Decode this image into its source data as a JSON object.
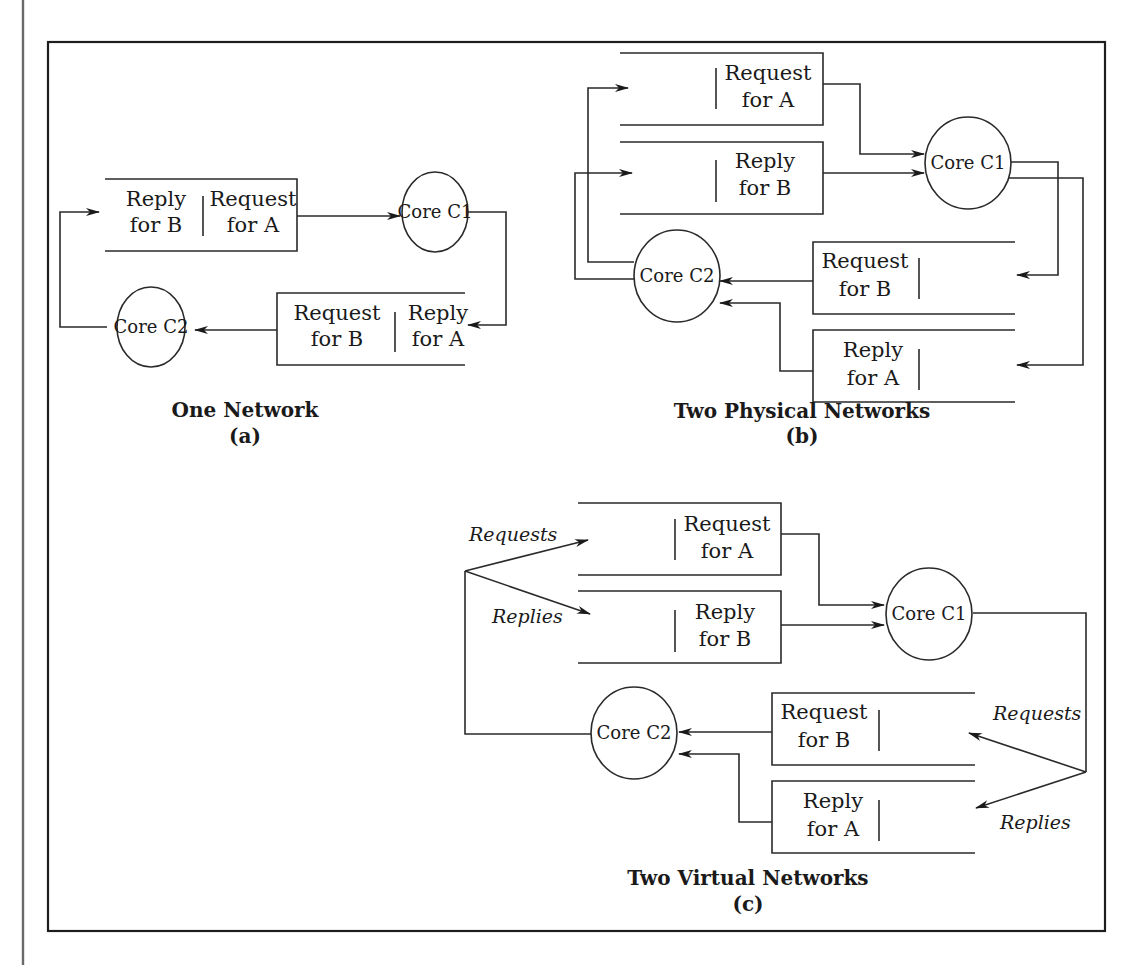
{
  "figure": {
    "panels": [
      {
        "id": "a",
        "title": "One Network",
        "label": "(a)",
        "cores": [
          {
            "name": "Core C1"
          },
          {
            "name": "Core C2"
          }
        ],
        "buffers": [
          {
            "left": {
              "line1": "Reply",
              "line2": "for B"
            },
            "right": {
              "line1": "Request",
              "line2": "for A"
            }
          },
          {
            "left": {
              "line1": "Request",
              "line2": "for B"
            },
            "right": {
              "line1": "Reply",
              "line2": "for A"
            }
          }
        ]
      },
      {
        "id": "b",
        "title": "Two Physical Networks",
        "label": "(b)",
        "cores": [
          {
            "name": "Core C1"
          },
          {
            "name": "Core C2"
          }
        ],
        "buffers": [
          {
            "line1": "Request",
            "line2": "for A"
          },
          {
            "line1": "Reply",
            "line2": "for B"
          },
          {
            "line1": "Request",
            "line2": "for B"
          },
          {
            "line1": "Reply",
            "line2": "for A"
          }
        ]
      },
      {
        "id": "c",
        "title": "Two Virtual Networks",
        "label": "(c)",
        "cores": [
          {
            "name": "Core C1"
          },
          {
            "name": "Core C2"
          }
        ],
        "buffers": [
          {
            "line1": "Request",
            "line2": "for A"
          },
          {
            "line1": "Reply",
            "line2": "for B"
          },
          {
            "line1": "Request",
            "line2": "for B"
          },
          {
            "line1": "Reply",
            "line2": "for A"
          }
        ],
        "annotations": {
          "left_requests": "Requests",
          "left_replies": "Replies",
          "right_requests": "Requests",
          "right_replies": "Replies"
        }
      }
    ]
  }
}
